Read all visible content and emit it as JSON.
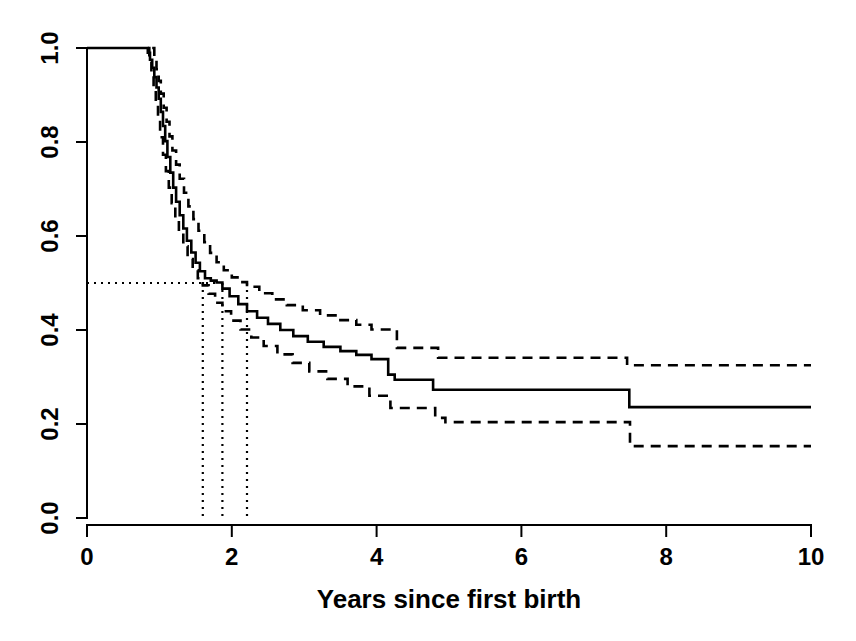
{
  "figure": {
    "background_color": "#ffffff",
    "foreground_color": "#000000"
  },
  "chart_data": {
    "type": "line",
    "subtype": "kaplan-meier-survival-curve",
    "title": "",
    "xlabel": "Years since first birth",
    "ylabel": "",
    "xlim": [
      0,
      10
    ],
    "ylim": [
      0,
      1
    ],
    "grid": false,
    "legend_position": "none",
    "x_ticks": {
      "values": [
        0,
        2,
        4,
        6,
        8,
        10
      ],
      "labels": [
        "0",
        "2",
        "4",
        "6",
        "8",
        "10"
      ]
    },
    "y_ticks": {
      "values": [
        0.0,
        0.2,
        0.4,
        0.6,
        0.8,
        1.0
      ],
      "labels": [
        "0.0",
        "0.2",
        "0.4",
        "0.6",
        "0.8",
        "1.0"
      ]
    },
    "series": [
      {
        "name": "survival-estimate",
        "line_style": "solid",
        "step": true,
        "x_end": 10,
        "points": [
          [
            0,
            1.0
          ],
          [
            0.84,
            0.99
          ],
          [
            0.87,
            0.975
          ],
          [
            0.9,
            0.958
          ],
          [
            0.93,
            0.938
          ],
          [
            0.96,
            0.916
          ],
          [
            0.99,
            0.892
          ],
          [
            1.02,
            0.864
          ],
          [
            1.05,
            0.834
          ],
          [
            1.08,
            0.802
          ],
          [
            1.11,
            0.768
          ],
          [
            1.15,
            0.735
          ],
          [
            1.19,
            0.703
          ],
          [
            1.23,
            0.673
          ],
          [
            1.28,
            0.644
          ],
          [
            1.33,
            0.616
          ],
          [
            1.38,
            0.59
          ],
          [
            1.44,
            0.565
          ],
          [
            1.5,
            0.543
          ],
          [
            1.56,
            0.525
          ],
          [
            1.63,
            0.51
          ],
          [
            1.71,
            0.505
          ],
          [
            1.79,
            0.501
          ],
          [
            1.87,
            0.488
          ],
          [
            1.97,
            0.472
          ],
          [
            2.09,
            0.455
          ],
          [
            2.21,
            0.44
          ],
          [
            2.35,
            0.426
          ],
          [
            2.5,
            0.413
          ],
          [
            2.67,
            0.4
          ],
          [
            2.85,
            0.387
          ],
          [
            3.05,
            0.375
          ],
          [
            3.27,
            0.364
          ],
          [
            3.5,
            0.355
          ],
          [
            3.72,
            0.347
          ],
          [
            3.93,
            0.338
          ],
          [
            4.16,
            0.305
          ],
          [
            4.25,
            0.294
          ],
          [
            4.78,
            0.273
          ],
          [
            7.49,
            0.236
          ]
        ]
      },
      {
        "name": "upper-95-percent-ci",
        "line_style": "dashed",
        "step": true,
        "x_end": 10,
        "points": [
          [
            0.9,
            1.0
          ],
          [
            0.93,
            0.978
          ],
          [
            0.96,
            0.955
          ],
          [
            0.99,
            0.93
          ],
          [
            1.02,
            0.903
          ],
          [
            1.06,
            0.873
          ],
          [
            1.1,
            0.843
          ],
          [
            1.14,
            0.812
          ],
          [
            1.18,
            0.782
          ],
          [
            1.23,
            0.752
          ],
          [
            1.28,
            0.722
          ],
          [
            1.34,
            0.692
          ],
          [
            1.4,
            0.663
          ],
          [
            1.47,
            0.636
          ],
          [
            1.54,
            0.611
          ],
          [
            1.62,
            0.587
          ],
          [
            1.7,
            0.564
          ],
          [
            1.79,
            0.544
          ],
          [
            1.89,
            0.527
          ],
          [
            2.0,
            0.512
          ],
          [
            2.12,
            0.502
          ],
          [
            2.21,
            0.492
          ],
          [
            2.38,
            0.478
          ],
          [
            2.56,
            0.465
          ],
          [
            2.76,
            0.453
          ],
          [
            2.98,
            0.442
          ],
          [
            3.22,
            0.431
          ],
          [
            3.48,
            0.421
          ],
          [
            3.72,
            0.411
          ],
          [
            3.93,
            0.401
          ],
          [
            4.28,
            0.362
          ],
          [
            4.85,
            0.341
          ],
          [
            7.46,
            0.325
          ]
        ]
      },
      {
        "name": "lower-95-percent-ci",
        "line_style": "dashed",
        "step": true,
        "x_end": 10,
        "points": [
          [
            0.84,
            1.0
          ],
          [
            0.86,
            0.97
          ],
          [
            0.89,
            0.942
          ],
          [
            0.92,
            0.912
          ],
          [
            0.95,
            0.88
          ],
          [
            0.98,
            0.846
          ],
          [
            1.01,
            0.81
          ],
          [
            1.05,
            0.773
          ],
          [
            1.09,
            0.738
          ],
          [
            1.13,
            0.703
          ],
          [
            1.17,
            0.67
          ],
          [
            1.22,
            0.638
          ],
          [
            1.27,
            0.608
          ],
          [
            1.33,
            0.578
          ],
          [
            1.39,
            0.551
          ],
          [
            1.46,
            0.527
          ],
          [
            1.53,
            0.51
          ],
          [
            1.6,
            0.495
          ],
          [
            1.68,
            0.477
          ],
          [
            1.77,
            0.458
          ],
          [
            1.87,
            0.44
          ],
          [
            1.99,
            0.42
          ],
          [
            2.12,
            0.401
          ],
          [
            2.27,
            0.384
          ],
          [
            2.44,
            0.366
          ],
          [
            2.63,
            0.348
          ],
          [
            2.84,
            0.33
          ],
          [
            3.07,
            0.312
          ],
          [
            3.32,
            0.296
          ],
          [
            3.6,
            0.28
          ],
          [
            3.9,
            0.26
          ],
          [
            4.19,
            0.234
          ],
          [
            4.81,
            0.213
          ],
          [
            4.95,
            0.204
          ],
          [
            7.5,
            0.153
          ]
        ]
      }
    ],
    "median_annotation": {
      "line_style": "dotted",
      "survival_level": 0.5,
      "horizontal_extent_years": [
        0,
        1.8
      ],
      "vertical_lines_years": [
        1.6,
        1.87,
        2.21
      ]
    }
  }
}
